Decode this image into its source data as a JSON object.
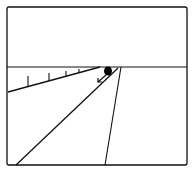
{
  "diagram": {
    "type": "perspective-road-scene",
    "colors": {
      "stroke": "#111111",
      "background": "#ffffff",
      "object": "#000000"
    },
    "frame": {
      "x": 7,
      "y": 7,
      "w": 180,
      "h": 158,
      "rx": 2
    },
    "horizon": {
      "y": 67
    },
    "fence": {
      "line": {
        "x1": 8,
        "y1": 92,
        "x2": 100,
        "y2": 67
      },
      "posts": [
        {
          "x": 28,
          "top": 76,
          "bottom": 87
        },
        {
          "x": 49,
          "top": 73,
          "bottom": 81
        },
        {
          "x": 66,
          "top": 71,
          "bottom": 77
        },
        {
          "x": 79,
          "top": 69,
          "bottom": 73
        }
      ]
    },
    "road": {
      "left_edge": {
        "x1": 16,
        "y1": 165,
        "x2": 118,
        "y2": 68
      },
      "right_edge": {
        "x1": 105,
        "y1": 165,
        "x2": 121,
        "y2": 67
      }
    },
    "object": {
      "cx": 108,
      "cy": 71,
      "rx": 4,
      "ry": 4.5,
      "label": ""
    },
    "arrow": {
      "x1": 106,
      "y1": 75,
      "x2": 98,
      "y2": 82
    }
  }
}
